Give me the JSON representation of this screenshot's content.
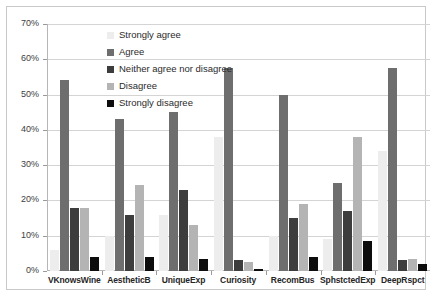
{
  "chart_data": {
    "type": "bar",
    "title": "",
    "subtitle": "",
    "xlabel": "",
    "ylabel": "",
    "ylim": [
      0,
      70
    ],
    "ytick_labels": [
      "0%",
      "10%",
      "20%",
      "30%",
      "40%",
      "50%",
      "60%",
      "70%"
    ],
    "ytick_values": [
      0,
      10,
      20,
      30,
      40,
      50,
      60,
      70
    ],
    "grid": true,
    "legend_position": "inside-top-left",
    "categories": [
      "VKnowsWine",
      "AestheticB",
      "UniqueExp",
      "Curiosity",
      "RecomBus",
      "SphstctedExp",
      "DeepRspct"
    ],
    "series": [
      {
        "name": "Strongly agree",
        "color": "#ededed",
        "values": [
          6,
          10,
          16,
          38,
          10,
          9,
          34
        ]
      },
      {
        "name": "Agree",
        "color": "#6e6e6e",
        "values": [
          54,
          43,
          45,
          57.5,
          50,
          25,
          57.5
        ]
      },
      {
        "name": "Neither agree nor disagree",
        "color": "#3d3d3d",
        "values": [
          18,
          16,
          23,
          3,
          15,
          17,
          3
        ]
      },
      {
        "name": "Disagree",
        "color": "#b4b4b4",
        "values": [
          18,
          24.5,
          13,
          2.5,
          19,
          38,
          3.5
        ]
      },
      {
        "name": "Strongly disagree",
        "color": "#0d0d0d",
        "values": [
          4,
          4,
          3.5,
          0.5,
          4,
          8.5,
          2
        ]
      }
    ]
  }
}
